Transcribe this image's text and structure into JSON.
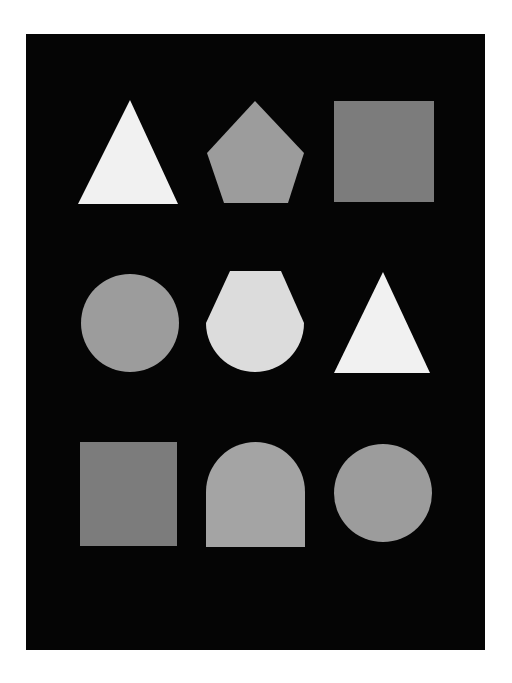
{
  "panel": {
    "background": "#050505"
  },
  "colors": {
    "white": "#f1f1f1",
    "light_gray": "#dcdcdc",
    "mid_gray": "#9c9c9c",
    "arch_gray": "#a4a4a4",
    "dark_gray": "#7c7c7c"
  },
  "shapes": [
    {
      "row": 1,
      "col": 1,
      "type": "triangle",
      "shade": "white"
    },
    {
      "row": 1,
      "col": 2,
      "type": "pentagon",
      "shade": "mid_gray"
    },
    {
      "row": 1,
      "col": 3,
      "type": "square",
      "shade": "dark_gray"
    },
    {
      "row": 2,
      "col": 1,
      "type": "circle",
      "shade": "mid_gray"
    },
    {
      "row": 2,
      "col": 2,
      "type": "truncated-circle",
      "shade": "light_gray"
    },
    {
      "row": 2,
      "col": 3,
      "type": "triangle",
      "shade": "white"
    },
    {
      "row": 3,
      "col": 1,
      "type": "square",
      "shade": "dark_gray"
    },
    {
      "row": 3,
      "col": 2,
      "type": "arch",
      "shade": "arch_gray"
    },
    {
      "row": 3,
      "col": 3,
      "type": "circle",
      "shade": "mid_gray"
    }
  ]
}
